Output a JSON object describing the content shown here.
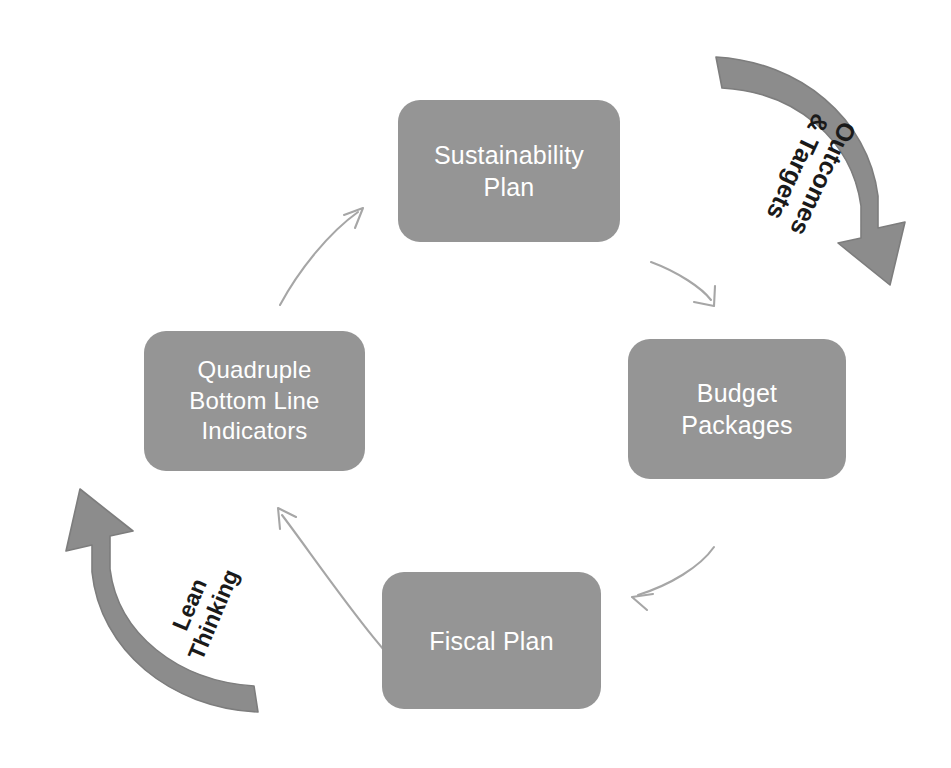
{
  "diagram": {
    "background_color": "#ffffff",
    "node_fill_color": "#959595",
    "node_text_color": "#ffffff",
    "arc_arrow_color": "#8c8c8c",
    "connector_arrow_color": "#a6a6a6",
    "arc_label_color": "#1a1a1a",
    "nodes": [
      {
        "id": "sustainability-plan",
        "label": "Sustainability\nPlan"
      },
      {
        "id": "budget-packages",
        "label": "Budget\nPackages"
      },
      {
        "id": "fiscal-plan",
        "label": "Fiscal Plan"
      },
      {
        "id": "quadruple-bottom-line",
        "label": "Quadruple\nBottom Line\nIndicators"
      }
    ],
    "arc_labels": [
      {
        "id": "outcomes-targets",
        "label": "Outcomes\n& Targets"
      },
      {
        "id": "lean-thinking",
        "label": "Lean\nThinking"
      }
    ],
    "connectors": [
      {
        "id": "sustainability-to-budget",
        "from": "Sustainability Plan",
        "to": "Budget Packages"
      },
      {
        "id": "budget-to-fiscal",
        "from": "Budget Packages",
        "to": "Fiscal Plan"
      },
      {
        "id": "fiscal-to-quadruple",
        "from": "Fiscal Plan",
        "to": "Quadruple Bottom Line Indicators"
      },
      {
        "id": "quadruple-to-sustainability",
        "from": "Quadruple Bottom Line Indicators",
        "to": "Sustainability Plan"
      }
    ]
  }
}
